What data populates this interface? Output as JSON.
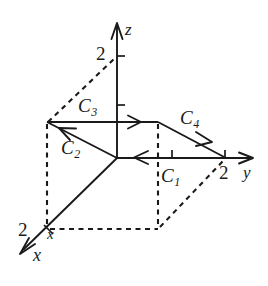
{
  "figure": {
    "background_color": "#ffffff",
    "ink_color": "#1a1a1a",
    "axes": [
      {
        "name": "x",
        "label": "x",
        "direction": "lower-left"
      },
      {
        "name": "y",
        "label": "y",
        "direction": "right"
      },
      {
        "name": "z",
        "label": "z",
        "direction": "up"
      }
    ],
    "axis_labels": {
      "x_primary": "x",
      "x_secondary": "x",
      "y": "y",
      "z": "z"
    },
    "tick_values": {
      "x": "2",
      "y": "2",
      "z": "2"
    },
    "curves": [
      {
        "name": "C1",
        "base": "C",
        "subscript": "1",
        "direction": "leftward along y-axis"
      },
      {
        "name": "C2",
        "base": "C",
        "subscript": "2",
        "direction": "up-left from origin"
      },
      {
        "name": "C3",
        "base": "C",
        "subscript": "3",
        "direction": "rightward along top edge"
      },
      {
        "name": "C4",
        "base": "C",
        "subscript": "4",
        "direction": "down-right to y = 2"
      }
    ]
  }
}
